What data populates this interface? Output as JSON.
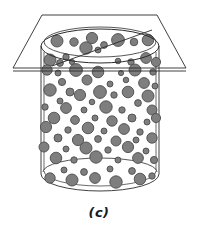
{
  "figure": {
    "caption": "(c)",
    "background_color": "#ffffff",
    "line_color": "#2b2b2b",
    "stroke_width": 0.9
  },
  "cylinder": {
    "label": "cylinder",
    "center_x": 100,
    "left_wall_x": 41,
    "right_wall_x": 159,
    "wall_inset": 3,
    "top_ellipse_cy": 46,
    "top_ellipse_rx": 59,
    "top_ellipse_ry": 17,
    "rim_offset": 4,
    "bottom_ellipse_cy": 174,
    "bottom_ellipse_rx": 59,
    "bottom_ellipse_ry": 17,
    "body_top_y": 46,
    "body_bottom_y": 174,
    "fill_color": "#ffffff"
  },
  "plane": {
    "label": "cutting-plane",
    "fill_color": "none",
    "edge_color": "#2b2b2b",
    "vertices": [
      {
        "x": 42,
        "y": 15
      },
      {
        "x": 157,
        "y": 15
      },
      {
        "x": 186,
        "y": 68
      },
      {
        "x": 13,
        "y": 68
      }
    ],
    "near_edge_y": 71,
    "intersection_line": {
      "x1": 52,
      "y1": 66,
      "x2": 152,
      "y2": 30
    }
  },
  "particles": {
    "label": "suspended-particles",
    "fill_color": "#7e7e7e",
    "stroke_color": "#4d4d4d",
    "count": 86,
    "items": [
      {
        "cx": 57,
        "cy": 41,
        "r": 6.0
      },
      {
        "cx": 74,
        "cy": 42,
        "r": 4.2
      },
      {
        "cx": 92,
        "cy": 38,
        "r": 5.6
      },
      {
        "cx": 104,
        "cy": 45,
        "r": 3.4
      },
      {
        "cx": 118,
        "cy": 40,
        "r": 6.4
      },
      {
        "cx": 134,
        "cy": 42,
        "r": 3.8
      },
      {
        "cx": 148,
        "cy": 40,
        "r": 5.8
      },
      {
        "cx": 86,
        "cy": 48,
        "r": 6.2
      },
      {
        "cx": 98,
        "cy": 50,
        "r": 3.0
      },
      {
        "cx": 66,
        "cy": 57,
        "r": 3.2
      },
      {
        "cx": 50,
        "cy": 60,
        "r": 6.0
      },
      {
        "cx": 60,
        "cy": 63,
        "r": 3.4
      },
      {
        "cx": 72,
        "cy": 62,
        "r": 2.6
      },
      {
        "cx": 118,
        "cy": 61,
        "r": 2.8
      },
      {
        "cx": 131,
        "cy": 62,
        "r": 3.2
      },
      {
        "cx": 146,
        "cy": 58,
        "r": 5.4
      },
      {
        "cx": 156,
        "cy": 62,
        "r": 4.6
      },
      {
        "cx": 47,
        "cy": 70,
        "r": 5.2
      },
      {
        "cx": 58,
        "cy": 73,
        "r": 3.0
      },
      {
        "cx": 76,
        "cy": 70,
        "r": 6.4
      },
      {
        "cx": 98,
        "cy": 72,
        "r": 5.8
      },
      {
        "cx": 121,
        "cy": 73,
        "r": 2.6
      },
      {
        "cx": 135,
        "cy": 70,
        "r": 6.0
      },
      {
        "cx": 153,
        "cy": 72,
        "r": 3.2
      },
      {
        "cx": 62,
        "cy": 82,
        "r": 3.6
      },
      {
        "cx": 87,
        "cy": 80,
        "r": 5.0
      },
      {
        "cx": 110,
        "cy": 84,
        "r": 3.0
      },
      {
        "cx": 126,
        "cy": 80,
        "r": 2.8
      },
      {
        "cx": 144,
        "cy": 83,
        "r": 5.4
      },
      {
        "cx": 155,
        "cy": 86,
        "r": 3.0
      },
      {
        "cx": 50,
        "cy": 90,
        "r": 6.2
      },
      {
        "cx": 70,
        "cy": 92,
        "r": 4.0
      },
      {
        "cx": 80,
        "cy": 95,
        "r": 5.6
      },
      {
        "cx": 100,
        "cy": 92,
        "r": 6.4
      },
      {
        "cx": 114,
        "cy": 95,
        "r": 3.2
      },
      {
        "cx": 128,
        "cy": 92,
        "r": 5.8
      },
      {
        "cx": 148,
        "cy": 96,
        "r": 6.0
      },
      {
        "cx": 60,
        "cy": 101,
        "r": 3.0
      },
      {
        "cx": 92,
        "cy": 102,
        "r": 2.8
      },
      {
        "cx": 138,
        "cy": 103,
        "r": 3.4
      },
      {
        "cx": 45,
        "cy": 107,
        "r": 3.2
      },
      {
        "cx": 66,
        "cy": 108,
        "r": 5.4
      },
      {
        "cx": 84,
        "cy": 110,
        "r": 3.0
      },
      {
        "cx": 106,
        "cy": 107,
        "r": 6.2
      },
      {
        "cx": 122,
        "cy": 110,
        "r": 3.2
      },
      {
        "cx": 152,
        "cy": 110,
        "r": 5.0
      },
      {
        "cx": 54,
        "cy": 118,
        "r": 5.8
      },
      {
        "cx": 75,
        "cy": 120,
        "r": 4.4
      },
      {
        "cx": 95,
        "cy": 118,
        "r": 3.0
      },
      {
        "cx": 112,
        "cy": 121,
        "r": 5.2
      },
      {
        "cx": 132,
        "cy": 118,
        "r": 4.0
      },
      {
        "cx": 147,
        "cy": 122,
        "r": 3.0
      },
      {
        "cx": 156,
        "cy": 118,
        "r": 4.6
      },
      {
        "cx": 46,
        "cy": 127,
        "r": 5.6
      },
      {
        "cx": 68,
        "cy": 130,
        "r": 3.2
      },
      {
        "cx": 88,
        "cy": 128,
        "r": 5.8
      },
      {
        "cx": 104,
        "cy": 131,
        "r": 3.0
      },
      {
        "cx": 124,
        "cy": 129,
        "r": 5.4
      },
      {
        "cx": 140,
        "cy": 132,
        "r": 3.2
      },
      {
        "cx": 58,
        "cy": 138,
        "r": 4.0
      },
      {
        "cx": 78,
        "cy": 140,
        "r": 5.6
      },
      {
        "cx": 98,
        "cy": 139,
        "r": 3.4
      },
      {
        "cx": 116,
        "cy": 141,
        "r": 5.0
      },
      {
        "cx": 136,
        "cy": 140,
        "r": 3.0
      },
      {
        "cx": 152,
        "cy": 138,
        "r": 5.2
      },
      {
        "cx": 44,
        "cy": 147,
        "r": 5.0
      },
      {
        "cx": 66,
        "cy": 149,
        "r": 3.0
      },
      {
        "cx": 86,
        "cy": 148,
        "r": 6.0
      },
      {
        "cx": 108,
        "cy": 150,
        "r": 3.2
      },
      {
        "cx": 128,
        "cy": 147,
        "r": 5.6
      },
      {
        "cx": 146,
        "cy": 151,
        "r": 3.0
      },
      {
        "cx": 56,
        "cy": 158,
        "r": 5.8
      },
      {
        "cx": 74,
        "cy": 160,
        "r": 3.2
      },
      {
        "cx": 96,
        "cy": 157,
        "r": 6.2
      },
      {
        "cx": 118,
        "cy": 160,
        "r": 3.0
      },
      {
        "cx": 138,
        "cy": 158,
        "r": 5.4
      },
      {
        "cx": 154,
        "cy": 160,
        "r": 3.6
      },
      {
        "cx": 64,
        "cy": 170,
        "r": 3.0
      },
      {
        "cx": 84,
        "cy": 172,
        "r": 3.4
      },
      {
        "cx": 110,
        "cy": 169,
        "r": 3.0
      },
      {
        "cx": 132,
        "cy": 171,
        "r": 3.4
      },
      {
        "cx": 50,
        "cy": 178,
        "r": 5.2
      },
      {
        "cx": 72,
        "cy": 180,
        "r": 6.0
      },
      {
        "cx": 95,
        "cy": 178,
        "r": 5.4
      },
      {
        "cx": 116,
        "cy": 182,
        "r": 6.2
      },
      {
        "cx": 140,
        "cy": 179,
        "r": 5.8
      },
      {
        "cx": 152,
        "cy": 176,
        "r": 3.2
      }
    ]
  }
}
